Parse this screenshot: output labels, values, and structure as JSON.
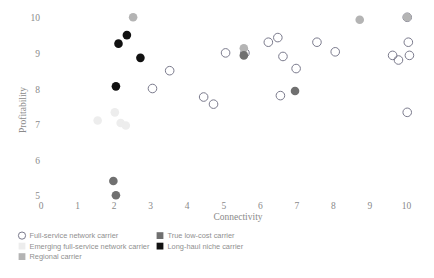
{
  "chart_data": {
    "type": "scatter",
    "title": "",
    "xlabel": "Connectivity",
    "ylabel": "Profitability",
    "xlim": [
      -0.35,
      10.6
    ],
    "ylim": [
      4.55,
      10.45
    ],
    "xticks": [
      0,
      1,
      2,
      3,
      4,
      5,
      6,
      7,
      8,
      9,
      10
    ],
    "yticks": [
      5,
      6,
      7,
      8,
      9,
      10
    ],
    "xtick_labels": [
      "0",
      "1",
      "2",
      "3",
      "4",
      "5",
      "6",
      "7",
      "8",
      "9",
      "10"
    ],
    "ytick_labels": [
      "5",
      "6",
      "7",
      "8",
      "9",
      "10"
    ],
    "grid": false,
    "legend_position": "below-axes",
    "series": [
      {
        "name": "Full-service network carrier",
        "key": "full_service",
        "marker": "open-circle",
        "color": "#7a7a8c",
        "fill": "none",
        "points": [
          [
            3.05,
            8.02
          ],
          [
            3.52,
            8.52
          ],
          [
            4.45,
            7.78
          ],
          [
            4.72,
            7.58
          ],
          [
            5.05,
            9.02
          ],
          [
            5.58,
            9.02
          ],
          [
            6.22,
            9.32
          ],
          [
            6.48,
            9.45
          ],
          [
            6.62,
            8.92
          ],
          [
            6.98,
            8.58
          ],
          [
            6.55,
            7.82
          ],
          [
            7.55,
            9.32
          ],
          [
            8.05,
            9.05
          ],
          [
            9.62,
            8.95
          ],
          [
            10.02,
            10.02
          ],
          [
            10.05,
            9.32
          ],
          [
            10.08,
            8.95
          ],
          [
            9.78,
            8.82
          ],
          [
            10.02,
            7.35
          ]
        ]
      },
      {
        "name": "Emerging full-service network carrier",
        "key": "emerging_full_service",
        "marker": "filled-circle",
        "color": "#ededed",
        "fill": "#ededed",
        "points": [
          [
            1.55,
            7.12
          ],
          [
            2.02,
            7.35
          ],
          [
            2.18,
            7.05
          ],
          [
            2.32,
            6.98
          ]
        ]
      },
      {
        "name": "Regional carrier",
        "key": "regional",
        "marker": "filled-circle",
        "color": "#b4b4b4",
        "fill": "#b4b4b4",
        "points": [
          [
            2.52,
            10.02
          ],
          [
            5.55,
            9.15
          ],
          [
            8.72,
            9.95
          ],
          [
            10.02,
            10.02
          ]
        ]
      },
      {
        "name": "True low-cost carrier",
        "key": "true_low_cost",
        "marker": "filled-circle",
        "color": "#707070",
        "fill": "#707070",
        "points": [
          [
            5.55,
            8.95
          ],
          [
            6.95,
            7.95
          ],
          [
            1.98,
            5.42
          ],
          [
            2.05,
            5.02
          ]
        ]
      },
      {
        "name": "Long-haul niche carrier",
        "key": "long_haul_niche",
        "marker": "filled-circle",
        "color": "#111111",
        "fill": "#111111",
        "points": [
          [
            2.12,
            9.28
          ],
          [
            2.35,
            9.52
          ],
          [
            2.72,
            8.88
          ],
          [
            2.05,
            8.08
          ]
        ]
      }
    ]
  },
  "legend": {
    "entries": [
      {
        "label": "Full-service network carrier",
        "key": "full_service"
      },
      {
        "label": "Emerging full-service network carrier",
        "key": "emerging_full_service"
      },
      {
        "label": "Regional carrier",
        "key": "regional"
      },
      {
        "label": "True low-cost carrier",
        "key": "true_low_cost"
      },
      {
        "label": "Long-haul niche carrier",
        "key": "long_haul_niche"
      }
    ]
  },
  "colors": {
    "full_service_stroke": "#7a7a8c",
    "emerging_full_service": "#ededed",
    "regional": "#b4b4b4",
    "true_low_cost": "#707070",
    "long_haul_niche": "#111111",
    "text": "#8a8a8a",
    "background": "#ffffff"
  }
}
